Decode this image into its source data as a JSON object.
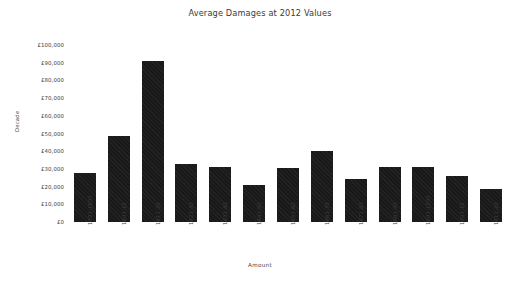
{
  "chart_data": {
    "type": "bar",
    "title": "Average Damages at 2012 Values",
    "xlabel": "Amount",
    "ylabel": "Decade",
    "ylim": [
      0,
      100000
    ],
    "grid": false,
    "legend": null,
    "ytick_labels": [
      "£100,000",
      "£90,000",
      "£80,000",
      "£70,000",
      "£60,000",
      "£50,000",
      "£40,000",
      "£30,000",
      "£20,000",
      "£10,000",
      "£0"
    ],
    "ytick_values": [
      100000,
      90000,
      80000,
      70000,
      60000,
      50000,
      40000,
      30000,
      20000,
      10000,
      0
    ],
    "categories": [
      "1791-1800",
      "1801-10",
      "1811-20",
      "1821-30",
      "1831-40",
      "1841-50",
      "1851-60",
      "1861-70",
      "1871-80",
      "1881-90",
      "1891-1900",
      "1901-10",
      "1911-20"
    ],
    "values": [
      27500,
      48500,
      91000,
      32500,
      31000,
      21000,
      30500,
      40000,
      24500,
      31000,
      31000,
      26000,
      18500
    ],
    "bar_color": "#191919"
  }
}
